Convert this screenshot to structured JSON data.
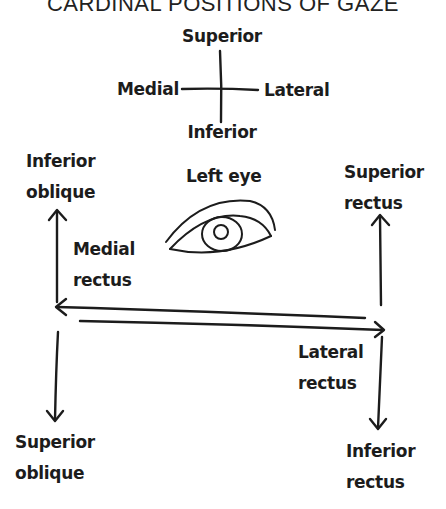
{
  "title": "CARDINAL POSITIONS OF GAZE",
  "compass": {
    "superior": "Superior",
    "inferior": "Inferior",
    "medial": "Medial",
    "lateral": "Lateral"
  },
  "eye": {
    "label": "Left eye"
  },
  "muscles": {
    "inferior_oblique": {
      "line1": "Inferior",
      "line2": "oblique",
      "direction": "up",
      "side": "medial"
    },
    "medial_rectus": {
      "line1": "Medial",
      "line2": "rectus",
      "direction": "left",
      "side": "medial"
    },
    "superior_oblique": {
      "line1": "Superior",
      "line2": "oblique",
      "direction": "down",
      "side": "medial"
    },
    "superior_rectus": {
      "line1": "Superior",
      "line2": "rectus",
      "direction": "up",
      "side": "lateral"
    },
    "lateral_rectus": {
      "line1": "Lateral",
      "line2": "rectus",
      "direction": "right",
      "side": "lateral"
    },
    "inferior_rectus": {
      "line1": "Inferior",
      "line2": "rectus",
      "direction": "down",
      "side": "lateral"
    }
  },
  "colors": {
    "ink": "#1c1c1c",
    "background": "#ffffff"
  }
}
